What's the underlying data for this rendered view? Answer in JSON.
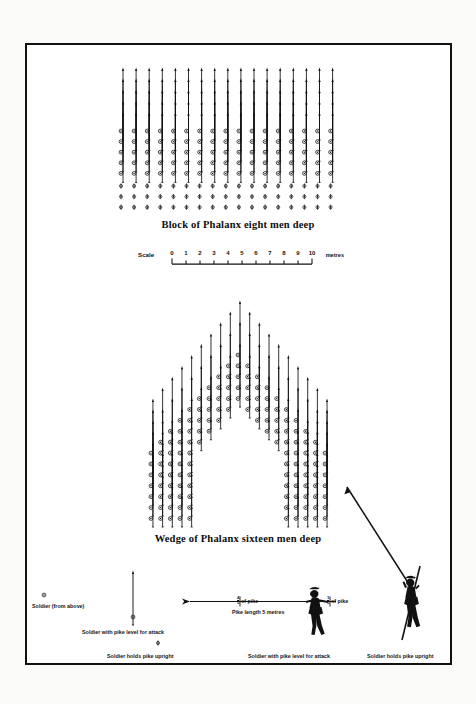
{
  "figure": {
    "title_block": "Block of Phalanx eight men deep",
    "title_wedge": "Wedge of Phalanx sixteen men deep",
    "ink_color": "#111111",
    "paper_color": "#ffffff"
  },
  "scale": {
    "label": "Scale",
    "ticks": [
      "0",
      "1",
      "2",
      "3",
      "4",
      "5",
      "6",
      "7",
      "8",
      "9",
      "10"
    ],
    "unit": "metres",
    "min": 0,
    "max": 10
  },
  "legend": {
    "soldier_from_above": "Soldier (from above)",
    "soldier_pike_level": "Soldier with pike level for attack",
    "soldier_pike_upright": "Soldier holds pike upright",
    "figure_pike_level": "Soldier with pike level for attack",
    "figure_pike_upright": "Soldier holds pike upright",
    "pike_length": "Pike length 5 metres",
    "frac_front_num": "4",
    "frac_front_den": "5",
    "frac_front_text": "of pike",
    "frac_rear_num": "1",
    "frac_rear_den": "5",
    "frac_rear_text": "of pike"
  },
  "chart_data": {
    "type": "diagram",
    "formations": [
      {
        "name": "block",
        "caption": "Block of Phalanx eight men deep",
        "columns": 17,
        "rows": 8,
        "rows_with_pike_level": 5,
        "rows_with_pike_upright": 3,
        "depth_men": 8
      },
      {
        "name": "wedge",
        "caption": "Wedge of Phalanx sixteen men deep",
        "depth_men": 16,
        "shape": "inverted-V / triangular wedge",
        "apex_rank": 1,
        "base_ranks": 16
      }
    ],
    "pike_length_metres": 5,
    "scale_min": 0,
    "scale_max": 10,
    "scale_unit": "metres"
  }
}
